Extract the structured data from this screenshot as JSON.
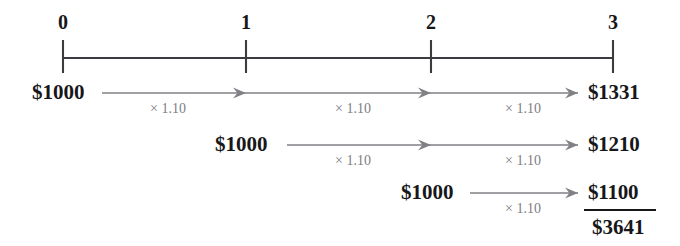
{
  "diagram": {
    "colors": {
      "axis": "#3c3c40",
      "text": "#17171a",
      "arrow": "#808086",
      "multiplier_text": "#7d7d83",
      "background": "#ffffff"
    },
    "axis": {
      "ticks": [
        {
          "label": "0",
          "x": 63
        },
        {
          "label": "1",
          "x": 246
        },
        {
          "label": "2",
          "x": 431
        },
        {
          "label": "3",
          "x": 613
        }
      ],
      "line_y": 58,
      "tick_top": 40,
      "tick_bottom": 73
    },
    "rows": [
      {
        "id": "row-period-0",
        "start_label": "$1000",
        "start_x": 32,
        "end_label": "$1331",
        "end_x": 588,
        "y": 93,
        "arrow_start_x": 102,
        "arrow_end_x": 578,
        "segments": [
          {
            "label": "× 1.10",
            "x": 168,
            "arrowhead_x": 246
          },
          {
            "label": "× 1.10",
            "x": 353,
            "arrowhead_x": 431
          },
          {
            "label": "× 1.10",
            "x": 523,
            "arrowhead_x": 578
          }
        ]
      },
      {
        "id": "row-period-1",
        "start_label": "$1000",
        "start_x": 215,
        "end_label": "$1210",
        "end_x": 588,
        "y": 145,
        "arrow_start_x": 287,
        "arrow_end_x": 578,
        "segments": [
          {
            "label": "× 1.10",
            "x": 353,
            "arrowhead_x": 431
          },
          {
            "label": "× 1.10",
            "x": 523,
            "arrowhead_x": 578
          }
        ]
      },
      {
        "id": "row-period-2",
        "start_label": "$1000",
        "start_x": 401,
        "end_label": "$1100",
        "end_x": 588,
        "y": 193,
        "arrow_start_x": 470,
        "arrow_end_x": 578,
        "segments": [
          {
            "label": "× 1.10",
            "x": 523,
            "arrowhead_x": 578
          }
        ]
      }
    ],
    "total": {
      "label": "$3641",
      "x": 592,
      "y": 228,
      "rule": {
        "x1": 584,
        "x2": 656,
        "y": 210
      }
    }
  }
}
